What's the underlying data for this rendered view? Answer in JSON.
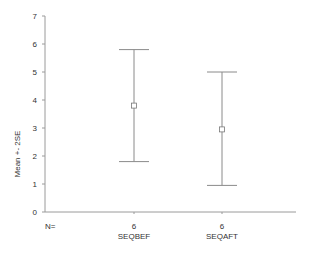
{
  "chart_data": {
    "type": "errorbar",
    "title": "",
    "xlabel": "",
    "ylabel": "Mean +- 2SE",
    "ylim": [
      0,
      7
    ],
    "yticks": [
      0,
      1,
      2,
      3,
      4,
      5,
      6,
      7
    ],
    "n_label": "N=",
    "grid": false,
    "categories": [
      "SEQBEF",
      "SEQAFT"
    ],
    "n": [
      6,
      6
    ],
    "mean": [
      3.8,
      2.95
    ],
    "upper": [
      5.8,
      5.0
    ],
    "lower": [
      1.8,
      0.95
    ]
  }
}
